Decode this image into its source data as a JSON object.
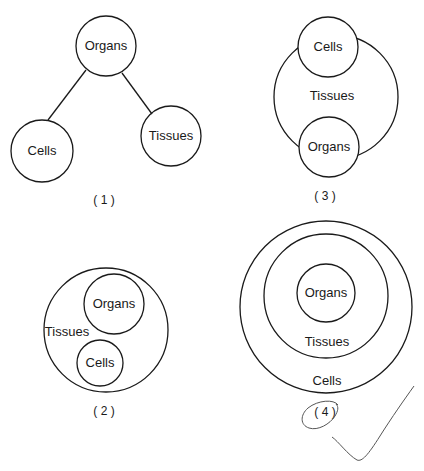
{
  "diagrams": [
    {
      "caption": "( 1 )",
      "labels": {
        "organs": "Organs",
        "cells": "Cells",
        "tissues": "Tissues"
      }
    },
    {
      "caption": "( 2 )",
      "labels": {
        "organs": "Organs",
        "cells": "Cells",
        "tissues": "Tissues"
      }
    },
    {
      "caption": "( 3 )",
      "labels": {
        "organs": "Organs",
        "cells": "Cells",
        "tissues": "Tissues"
      }
    },
    {
      "caption": "( 4 )",
      "labels": {
        "organs": "Organs",
        "cells": "Cells",
        "tissues": "Tissues"
      }
    }
  ],
  "annotations": {
    "selected_option": "( 4 )",
    "checkmark": "checkmark-icon",
    "circle_mark_color": "#555555"
  },
  "colors": {
    "stroke": "#1a1a1a",
    "background": "#ffffff"
  }
}
